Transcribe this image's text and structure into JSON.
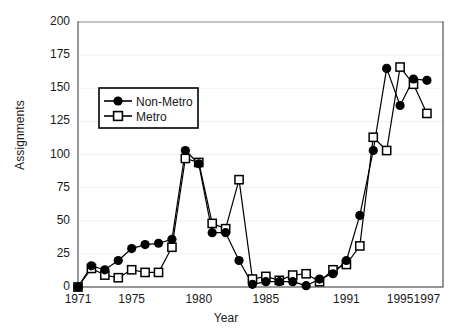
{
  "chart_data": {
    "type": "line",
    "title": "",
    "xlabel": "Year",
    "ylabel": "Assignments",
    "xlim": [
      1971,
      1997
    ],
    "ylim": [
      0,
      200
    ],
    "grid": false,
    "legend_position": "upper-left-inside",
    "x": [
      1971,
      1972,
      1973,
      1974,
      1975,
      1976,
      1977,
      1978,
      1979,
      1980,
      1981,
      1982,
      1983,
      1984,
      1985,
      1986,
      1987,
      1988,
      1989,
      1990,
      1991,
      1992,
      1993,
      1994,
      1995,
      1996,
      1997
    ],
    "series": [
      {
        "name": "Non-Metro",
        "marker": "filled-circle",
        "color": "#000000",
        "values": [
          0,
          16,
          13,
          20,
          29,
          32,
          33,
          36,
          103,
          93,
          41,
          41,
          20,
          2,
          4,
          4,
          4,
          1,
          6,
          10,
          20,
          54,
          103,
          165,
          137,
          157,
          156
        ]
      },
      {
        "name": "Metro",
        "marker": "open-square",
        "color": "#000000",
        "values": [
          0,
          14,
          9,
          7,
          13,
          11,
          11,
          30,
          97,
          94,
          48,
          44,
          81,
          6,
          8,
          5,
          9,
          10,
          4,
          13,
          17,
          31,
          113,
          103,
          166,
          153,
          131
        ]
      }
    ],
    "yticks": [
      0,
      25,
      50,
      75,
      100,
      125,
      150,
      175,
      200
    ],
    "ytick_labels": [
      "0",
      "25",
      "50",
      "75",
      "100",
      "125",
      "150",
      "175",
      "200"
    ],
    "xticks": [
      1971,
      1975,
      1980,
      1985,
      1991,
      1995,
      1997
    ],
    "xtick_labels": [
      "1971",
      "1975",
      "1980",
      "1985",
      "1991",
      "1995",
      "1997"
    ]
  },
  "legend": {
    "items": [
      {
        "label": "Non-Metro"
      },
      {
        "label": "Metro"
      }
    ]
  },
  "colors": {
    "frame": "#6b6b6b",
    "ink": "#1a1a1a",
    "series": "#000000",
    "background": "#ffffff"
  }
}
